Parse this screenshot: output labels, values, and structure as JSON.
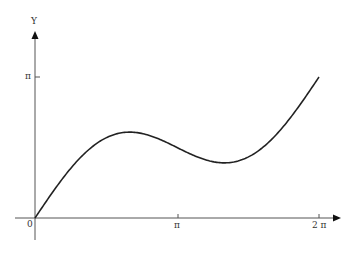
{
  "chart_data": {
    "type": "line",
    "title": "",
    "xlabel": "",
    "ylabel": "Y",
    "function": "y = x/2 + sin(x)",
    "x_tick_labels": [
      "0",
      "π",
      "2 π"
    ],
    "y_tick_labels": [
      "π"
    ],
    "xlim": [
      0,
      6.283
    ],
    "ylim": [
      0,
      3.6
    ],
    "grid": false,
    "series": [
      {
        "name": "curve",
        "x": [
          0,
          0.5,
          1.0,
          1.5,
          2.094,
          2.5,
          3.0,
          3.5,
          4.189,
          4.5,
          5.0,
          5.5,
          6.283
        ],
        "y": [
          0,
          0.73,
          1.34,
          1.75,
          1.91,
          1.85,
          1.64,
          1.4,
          1.23,
          1.27,
          1.54,
          2.04,
          3.14
        ]
      }
    ]
  },
  "labels": {
    "y_axis": "Y",
    "origin": "0",
    "x_pi": "π",
    "x_2pi": "2 π",
    "y_pi": "π"
  }
}
